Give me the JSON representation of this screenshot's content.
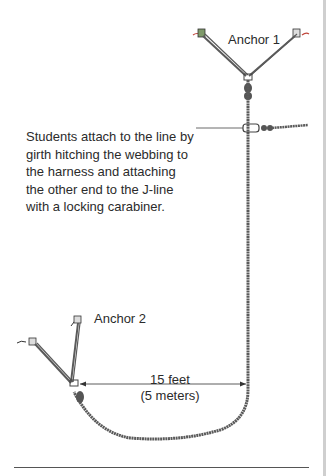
{
  "figure": {
    "labels": {
      "anchor1": "Anchor 1",
      "anchor2": "Anchor 2",
      "description": "Students attach to the line by girth hitching the webbing to the harness and attaching the other end to the J-line with a locking carabiner.",
      "distance_primary": "15 feet",
      "distance_secondary": "(5 meters)"
    },
    "colors": {
      "rope": "#5a5a5a",
      "anchor_green": "#7f9a6a",
      "anchor_red": "#c0463c",
      "text": "#2b2b2b",
      "border": "#cfcfcf"
    },
    "elements": [
      "anchor-1",
      "anchor-2",
      "j-line-rope",
      "carabiner-attachment",
      "distance-dimension"
    ]
  }
}
